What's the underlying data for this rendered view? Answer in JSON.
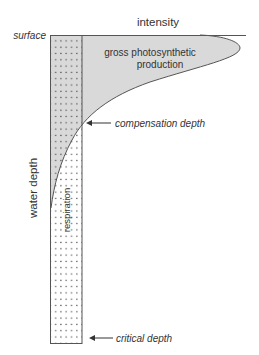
{
  "diagram": {
    "x_axis_label": "intensity",
    "y_axis_label": "water depth",
    "surface_label": "surface",
    "production_label_line1": "gross photosynthetic",
    "production_label_line2": "production",
    "respiration_label": "respiration",
    "compensation_label": "compensation depth",
    "critical_label": "critical depth",
    "colors": {
      "production_fill": "#d9d9d9",
      "outline": "#555555",
      "dots": "#444444",
      "text": "#333333"
    }
  }
}
